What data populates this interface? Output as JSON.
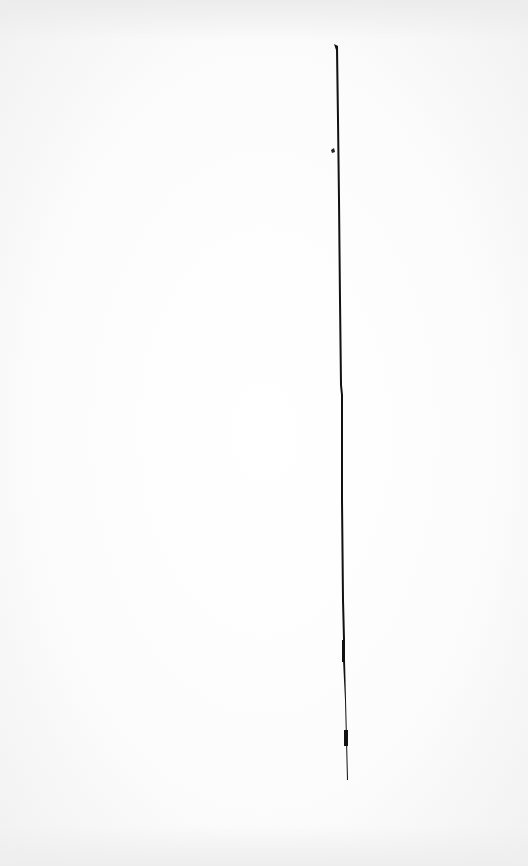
{
  "page": {
    "type": "scanned-blank-page",
    "background_color": "#fbfbfb",
    "rule_color": "#111111",
    "visible_text": []
  }
}
